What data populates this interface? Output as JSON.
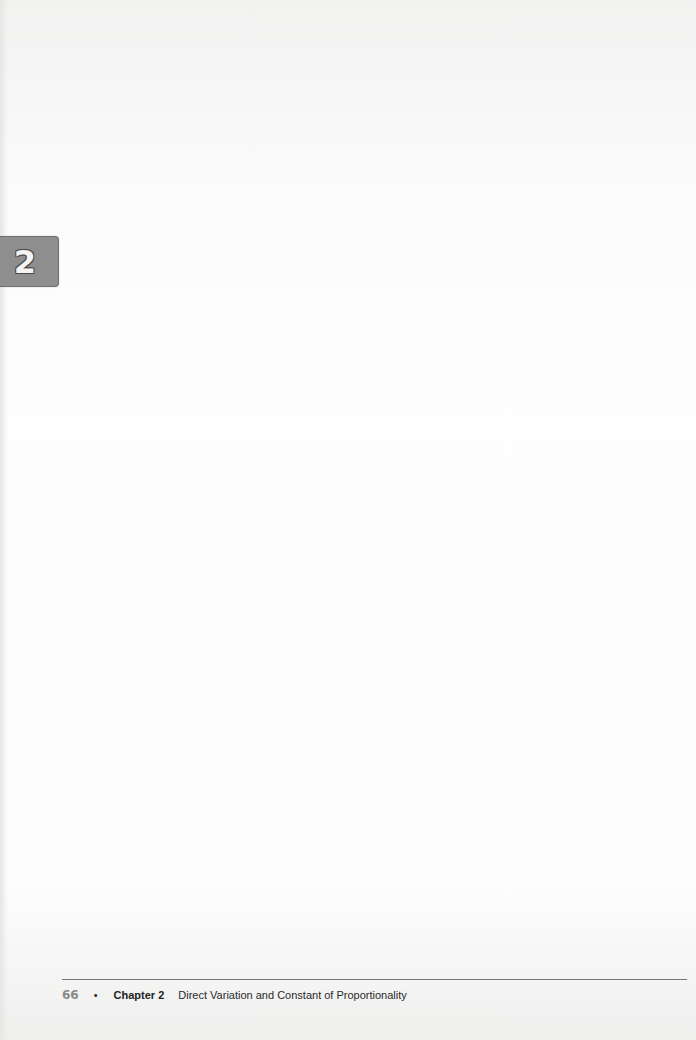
{
  "chapter_tab": {
    "number": "2",
    "color": "#8e8e8e"
  },
  "footer": {
    "page_number": "66",
    "bullet": "•",
    "chapter_label": "Chapter 2",
    "chapter_title": "Direct Variation and Constant of Proportionality",
    "rule_color": "#7a7a7a",
    "page_number_color": "#8a8a8a"
  }
}
